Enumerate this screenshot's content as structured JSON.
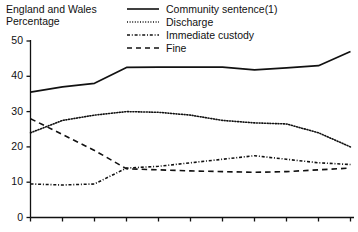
{
  "header": {
    "region_line": "England and Wales",
    "unit_line": "Percentage"
  },
  "legend": {
    "position": "top-center",
    "items": [
      {
        "label": "Community sentence(1)",
        "style": "solid",
        "key_icon": "solid-line-icon"
      },
      {
        "label": "Discharge",
        "style": "dotted",
        "key_icon": "dotted-line-icon"
      },
      {
        "label": "Immediate custody",
        "style": "dash-dot",
        "key_icon": "dash-dot-line-icon"
      },
      {
        "label": "Fine",
        "style": "dashed",
        "key_icon": "dashed-line-icon"
      }
    ]
  },
  "axes": {
    "y_ticks": [
      "0",
      "10",
      "20",
      "30",
      "40",
      "50"
    ],
    "x_ticks": [
      "",
      "",
      "",
      "",
      "",
      "",
      "",
      "",
      "",
      "",
      ""
    ]
  },
  "chart_data": {
    "type": "line",
    "title": "England and Wales Percentage",
    "xlabel": "",
    "ylabel": "Percentage",
    "ylim": [
      0,
      50
    ],
    "yticks": [
      0,
      10,
      20,
      30,
      40,
      50
    ],
    "grid": false,
    "legend_position": "top-center",
    "x": [
      1,
      2,
      3,
      4,
      5,
      6,
      7,
      8,
      9,
      10,
      11
    ],
    "series": [
      {
        "name": "Community sentence(1)",
        "style": "solid",
        "values": [
          35.5,
          37.0,
          38.0,
          42.5,
          42.6,
          42.6,
          42.6,
          41.8,
          42.4,
          43.0,
          47.0
        ]
      },
      {
        "name": "Discharge",
        "style": "dotted",
        "values": [
          24.0,
          27.5,
          29.0,
          30.0,
          29.8,
          29.0,
          27.5,
          26.8,
          26.5,
          24.0,
          20.0
        ]
      },
      {
        "name": "Immediate custody",
        "style": "dash-dot",
        "values": [
          9.5,
          9.2,
          9.5,
          14.0,
          14.5,
          15.5,
          16.5,
          17.5,
          16.5,
          15.5,
          15.0
        ]
      },
      {
        "name": "Fine",
        "style": "dashed",
        "values": [
          28.0,
          23.5,
          19.0,
          13.8,
          13.5,
          13.2,
          13.0,
          12.8,
          13.0,
          13.5,
          14.0
        ]
      }
    ]
  }
}
